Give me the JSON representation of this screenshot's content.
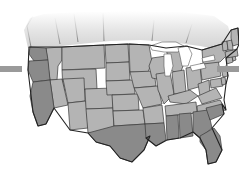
{
  "figure": {
    "name": "united-states-map",
    "background_color": "#ffffff",
    "width": 239,
    "height": 179
  },
  "palette": {
    "background": "#ffffff",
    "state_light": "#b4b4b4",
    "state_dark": "#8a8a8a",
    "state_border": "#3a3a3a",
    "outer_border": "#222222",
    "lake_fill": "#ffffff",
    "canada_fill": "#d8d8d8",
    "edge_bar": "#9a9a9a"
  },
  "legend": {
    "light_label": "Not highlighted",
    "dark_label": "Highlighted"
  },
  "edge_bars": [
    {
      "name": "edge-bar-left",
      "color": "#9a9a9a",
      "side": "left",
      "top": 66,
      "width": 22,
      "height": 6
    },
    {
      "name": "edge-bar-right",
      "color": "#9a9a9a",
      "side": "right",
      "top": 66,
      "width": 22,
      "height": 6
    }
  ],
  "water_bodies": [
    {
      "name": "lake-superior",
      "fill": "#ffffff"
    },
    {
      "name": "lake-michigan",
      "fill": "#ffffff"
    },
    {
      "name": "lake-huron",
      "fill": "#ffffff"
    },
    {
      "name": "lake-erie",
      "fill": "#ffffff"
    },
    {
      "name": "lake-ontario",
      "fill": "#ffffff"
    }
  ],
  "regions": {
    "canada": {
      "name": "canada-fade",
      "fill": "#d8d8d8",
      "fades_to": "#ffffff"
    }
  },
  "states": [
    {
      "code": "WA",
      "name": "Washington",
      "shade": "dark"
    },
    {
      "code": "OR",
      "name": "Oregon",
      "shade": "dark"
    },
    {
      "code": "CA",
      "name": "California",
      "shade": "dark"
    },
    {
      "code": "ID",
      "name": "Idaho",
      "shade": "light"
    },
    {
      "code": "NV",
      "name": "Nevada",
      "shade": "light"
    },
    {
      "code": "MT",
      "name": "Montana",
      "shade": "light"
    },
    {
      "code": "WY",
      "name": "Wyoming",
      "shade": "light"
    },
    {
      "code": "UT",
      "name": "Utah",
      "shade": "light"
    },
    {
      "code": "AZ",
      "name": "Arizona",
      "shade": "light"
    },
    {
      "code": "CO",
      "name": "Colorado",
      "shade": "light"
    },
    {
      "code": "NM",
      "name": "New Mexico",
      "shade": "light"
    },
    {
      "code": "ND",
      "name": "North Dakota",
      "shade": "light"
    },
    {
      "code": "SD",
      "name": "South Dakota",
      "shade": "light"
    },
    {
      "code": "NE",
      "name": "Nebraska",
      "shade": "light"
    },
    {
      "code": "KS",
      "name": "Kansas",
      "shade": "light"
    },
    {
      "code": "OK",
      "name": "Oklahoma",
      "shade": "light"
    },
    {
      "code": "TX",
      "name": "Texas",
      "shade": "dark"
    },
    {
      "code": "MN",
      "name": "Minnesota",
      "shade": "light"
    },
    {
      "code": "IA",
      "name": "Iowa",
      "shade": "light"
    },
    {
      "code": "MO",
      "name": "Missouri",
      "shade": "light"
    },
    {
      "code": "AR",
      "name": "Arkansas",
      "shade": "light"
    },
    {
      "code": "LA",
      "name": "Louisiana",
      "shade": "dark"
    },
    {
      "code": "WI",
      "name": "Wisconsin",
      "shade": "light"
    },
    {
      "code": "IL",
      "name": "Illinois",
      "shade": "light"
    },
    {
      "code": "MS",
      "name": "Mississippi",
      "shade": "dark"
    },
    {
      "code": "MI",
      "name": "Michigan",
      "shade": "light"
    },
    {
      "code": "IN",
      "name": "Indiana",
      "shade": "light"
    },
    {
      "code": "KY",
      "name": "Kentucky",
      "shade": "light"
    },
    {
      "code": "TN",
      "name": "Tennessee",
      "shade": "light"
    },
    {
      "code": "AL",
      "name": "Alabama",
      "shade": "dark"
    },
    {
      "code": "OH",
      "name": "Ohio",
      "shade": "light"
    },
    {
      "code": "WV",
      "name": "West Virginia",
      "shade": "light"
    },
    {
      "code": "VA",
      "name": "Virginia",
      "shade": "light"
    },
    {
      "code": "NC",
      "name": "North Carolina",
      "shade": "light"
    },
    {
      "code": "SC",
      "name": "South Carolina",
      "shade": "dark"
    },
    {
      "code": "GA",
      "name": "Georgia",
      "shade": "dark"
    },
    {
      "code": "FL",
      "name": "Florida",
      "shade": "dark"
    },
    {
      "code": "PA",
      "name": "Pennsylvania",
      "shade": "light"
    },
    {
      "code": "NY",
      "name": "New York",
      "shade": "light"
    },
    {
      "code": "MD",
      "name": "Maryland",
      "shade": "light"
    },
    {
      "code": "DE",
      "name": "Delaware",
      "shade": "light"
    },
    {
      "code": "NJ",
      "name": "New Jersey",
      "shade": "light"
    },
    {
      "code": "CT",
      "name": "Connecticut",
      "shade": "light"
    },
    {
      "code": "RI",
      "name": "Rhode Island",
      "shade": "light"
    },
    {
      "code": "MA",
      "name": "Massachusetts",
      "shade": "light"
    },
    {
      "code": "VT",
      "name": "Vermont",
      "shade": "light"
    },
    {
      "code": "NH",
      "name": "New Hampshire",
      "shade": "light"
    },
    {
      "code": "ME",
      "name": "Maine",
      "shade": "light"
    }
  ]
}
